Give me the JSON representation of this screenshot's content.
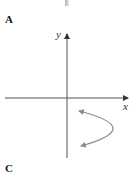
{
  "panels": {
    "top_label": "A",
    "bottom_label": "C"
  },
  "axes": {
    "x_label": "x",
    "y_label": "y",
    "axis_color": "#555555",
    "curve_color": "#8a8a8a"
  },
  "figure": {
    "curve": {
      "shape": "parabola opening left",
      "upper_end": [
        78,
        111
      ],
      "vertex": [
        121,
        128
      ],
      "lower_end": [
        80,
        146
      ],
      "arrows": "both ends"
    }
  }
}
